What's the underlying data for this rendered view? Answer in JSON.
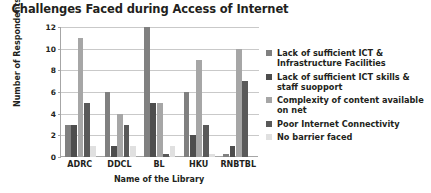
{
  "chart_data": {
    "type": "bar",
    "title": "Challenges Faced during Access of Internet",
    "xlabel": "Name of the Library",
    "ylabel": "Number of Respondents",
    "categories": [
      "ADRC",
      "DDCL",
      "BL",
      "HKU",
      "RNBTBL"
    ],
    "ylim": [
      0,
      12
    ],
    "yticks": [
      0,
      2,
      4,
      6,
      8,
      10,
      12
    ],
    "grid": true,
    "legend_position": "right",
    "series": [
      {
        "name": "Lack of sufficient ICT & Infrastructure Facilities",
        "color": "#808080",
        "values": [
          3,
          6,
          12,
          6,
          0.3
        ]
      },
      {
        "name": "Lack of sufficient ICT skills & staff suopport",
        "color": "#4d4d4d",
        "values": [
          3,
          1,
          5,
          2,
          1
        ]
      },
      {
        "name": "Complexity of content available on net",
        "color": "#a6a6a6",
        "values": [
          11,
          4,
          5,
          9,
          10
        ]
      },
      {
        "name": "Poor Internet Connectivity",
        "color": "#595959",
        "values": [
          5,
          3,
          0.3,
          3,
          7
        ]
      },
      {
        "name": "No barrier faced",
        "color": "#e0e0e0",
        "values": [
          1,
          1,
          1,
          0.3,
          0
        ]
      }
    ]
  }
}
